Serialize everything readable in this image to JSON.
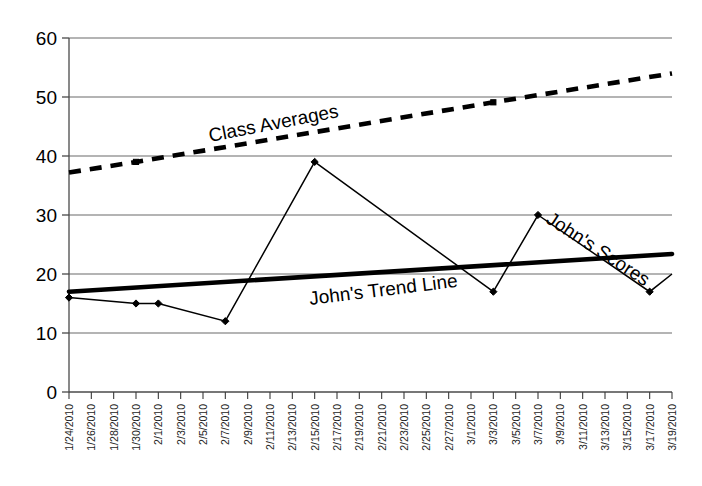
{
  "chart_data": {
    "type": "line",
    "title": "",
    "xlabel": "",
    "ylabel": "",
    "ylim": [
      0,
      60
    ],
    "ytick_step": 10,
    "grid": true,
    "legend": "inline-annotations",
    "categories": [
      "1/24/2010",
      "1/26/2010",
      "1/28/2010",
      "1/30/2010",
      "2/1/2010",
      "2/3/2010",
      "2/5/2010",
      "2/7/2010",
      "2/9/2010",
      "2/11/2010",
      "2/13/2010",
      "2/15/2010",
      "2/17/2010",
      "2/19/2010",
      "2/21/2010",
      "2/23/2010",
      "2/25/2010",
      "2/27/2010",
      "3/1/2010",
      "3/3/2010",
      "3/5/2010",
      "3/7/2010",
      "3/9/2010",
      "3/11/2010",
      "3/13/2010",
      "3/15/2010",
      "3/17/2010",
      "3/19/2010"
    ],
    "ytick_labels": [
      "0",
      "10",
      "20",
      "30",
      "40",
      "50",
      "60"
    ],
    "series": [
      {
        "name": "John's Scores",
        "style": "thin-solid-line-with-diamond-markers",
        "color": "#000000",
        "points": [
          {
            "x": "1/24/2010",
            "y": 16
          },
          {
            "x": "1/30/2010",
            "y": 15
          },
          {
            "x": "2/1/2010",
            "y": 15
          },
          {
            "x": "2/7/2010",
            "y": 12
          },
          {
            "x": "2/15/2010",
            "y": 39
          },
          {
            "x": "3/3/2010",
            "y": 17
          },
          {
            "x": "3/7/2010",
            "y": 30
          },
          {
            "x": "3/17/2010",
            "y": 17
          },
          {
            "x": "3/19/2010",
            "y": 20
          }
        ]
      },
      {
        "name": "Class Averages",
        "style": "thick-dashed-line-with-square-markers",
        "color": "#000000",
        "points": [
          {
            "x": "1/24/2010",
            "y": 37.2
          },
          {
            "x": "1/30/2010",
            "y": 39.0
          },
          {
            "x": "3/3/2010",
            "y": 49.1
          },
          {
            "x": "3/19/2010",
            "y": 54.0
          }
        ]
      },
      {
        "name": "John's Trend Line",
        "style": "thick-solid-line",
        "color": "#000000",
        "points": [
          {
            "x": "1/24/2010",
            "y": 17.0
          },
          {
            "x": "3/19/2010",
            "y": 23.4
          }
        ]
      }
    ],
    "annotations": [
      {
        "text": "Class Averages",
        "series": "Class Averages",
        "rotation": -11
      },
      {
        "text": "John's Scores",
        "series": "John's Scores",
        "rotation": 33
      },
      {
        "text": "John's Trend Line",
        "series": "John's Trend Line",
        "rotation": -7
      }
    ]
  }
}
